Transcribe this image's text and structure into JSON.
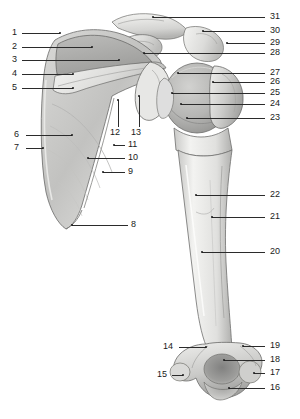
{
  "figure": {
    "view": "anterior",
    "background_color": "#ffffff",
    "ink_color": "#2b2b2b",
    "bone_fill_light": "#f2f2f0",
    "bone_fill_mid": "#cfcfcd",
    "bone_fill_dark": "#a8a8a6",
    "label_count": 31
  },
  "labels": {
    "n1": "1",
    "n2": "2",
    "n3": "3",
    "n4": "4",
    "n5": "5",
    "n6": "6",
    "n7": "7",
    "n8": "8",
    "n9": "9",
    "n10": "10",
    "n11": "11",
    "n12": "12",
    "n13": "13",
    "n14": "14",
    "n15": "15",
    "n16": "16",
    "n17": "17",
    "n18": "18",
    "n19": "19",
    "n20": "20",
    "n21": "21",
    "n22": "22",
    "n23": "23",
    "n24": "24",
    "n25": "25",
    "n26": "26",
    "n27": "27",
    "n28": "28",
    "n29": "29",
    "n30": "30",
    "n31": "31"
  }
}
